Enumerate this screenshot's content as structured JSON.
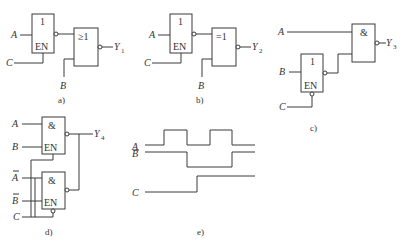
{
  "figure": {
    "panels": {
      "a": {
        "caption": "a)",
        "gate1_symbol": "1",
        "gate1_enable": "EN",
        "gate2_symbol": "≥1",
        "input_a": "A",
        "input_c": "C",
        "input_b": "B",
        "output": "Y",
        "output_sub": "1"
      },
      "b": {
        "caption": "b)",
        "gate1_symbol": "1",
        "gate1_enable": "EN",
        "gate2_symbol": "=1",
        "input_a": "A",
        "input_c": "C",
        "input_b": "B",
        "output": "Y",
        "output_sub": "2"
      },
      "c": {
        "caption": "c)",
        "gate1_symbol": "1",
        "gate1_enable": "EN",
        "gate2_symbol": "&",
        "input_a": "A",
        "input_b": "B",
        "input_c": "C",
        "output": "Y",
        "output_sub": "3"
      },
      "d": {
        "caption": "d)",
        "gate1_symbol": "&",
        "gate1_enable": "EN",
        "gate2_symbol": "&",
        "gate2_enable": "EN",
        "input_a": "A",
        "input_b": "B",
        "input_a_bar": "A",
        "input_b_bar": "B",
        "input_c": "C",
        "output": "Y",
        "output_sub": "4"
      },
      "e": {
        "caption": "e)",
        "signal_a": "A",
        "signal_b": "B",
        "signal_c": "C"
      }
    }
  },
  "waveforms": {
    "A": [
      0,
      1,
      0,
      1,
      0
    ],
    "B": [
      1,
      1,
      0,
      0,
      1
    ],
    "C": [
      0,
      0,
      0,
      1,
      1
    ]
  }
}
